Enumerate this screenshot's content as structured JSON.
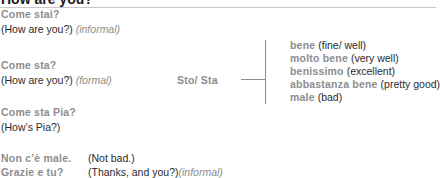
{
  "header": {
    "title": "How are you?"
  },
  "questions": [
    {
      "italian": "Come stai?",
      "english": "(How are you?)",
      "note": "(informal)"
    },
    {
      "italian": "Come sta?",
      "english": "(How are you?)",
      "note": "(formal)"
    },
    {
      "italian": "Come sta Pia?",
      "english": "(How’s Pia?)",
      "note": ""
    }
  ],
  "answer_stem": "Sto/ Sta",
  "answers": [
    {
      "italian": "bene",
      "english": "(fine/ well)"
    },
    {
      "italian": "molto bene",
      "english": "(very well)"
    },
    {
      "italian": "benissimo",
      "english": "(excellent)"
    },
    {
      "italian": "abbastanza bene",
      "english": "(pretty good)"
    },
    {
      "italian": "male",
      "english": "(bad)"
    }
  ],
  "replies": [
    {
      "italian": "Non c’è male.",
      "english": "(Not bad.)",
      "note": ""
    },
    {
      "italian": "Grazie e tu?",
      "english": "(Thanks, and you?)",
      "note": "(informal)"
    }
  ]
}
